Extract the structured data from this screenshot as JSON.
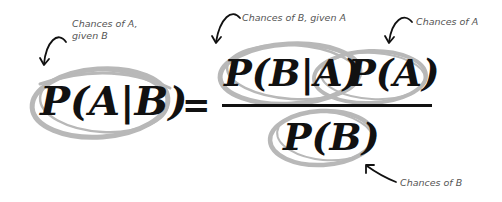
{
  "formula": {
    "lhs": "P(A|B)",
    "equals": "=",
    "numerator_term1": "P(B|A)",
    "numerator_term2": "P(A)",
    "denominator": "P(B)"
  },
  "annotations": {
    "lhs": "Chances of A,\ngiven B",
    "lhs_line1": "Chances of A,",
    "lhs_line2": "given B",
    "numerator_term1": "Chances of B, given A",
    "numerator_term2": "Chances of A",
    "denominator": "Chances of B"
  },
  "colors": {
    "ellipse": "#b8b8b8",
    "text": "#111111",
    "annotation": "#555555"
  }
}
